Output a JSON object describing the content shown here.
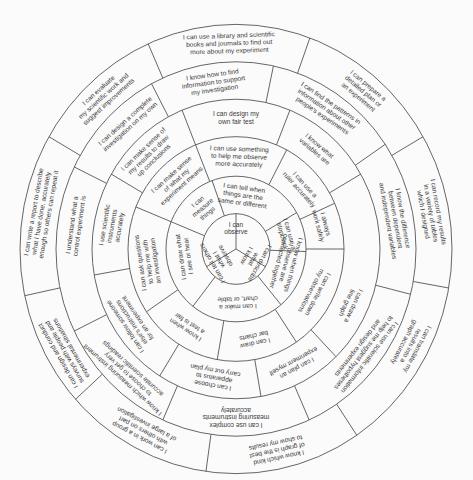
{
  "diagram": {
    "line_color": "#555555",
    "text_color": "#3a3a3a",
    "background": "#fbfbfb",
    "rings": [
      {
        "level": 1,
        "segments": [
          {
            "lines": [
              "I can",
              "observe"
            ],
            "angle": 0
          },
          {
            "lines": [
              "I can describe",
              "what",
              "I know"
            ],
            "angle": 120
          },
          {
            "lines": [
              "I can tell others",
              "what I",
              "observe"
            ],
            "angle": 240
          }
        ]
      },
      {
        "level": 2,
        "segments": [
          {
            "lines": [
              "I can tell when",
              "things are the",
              "same or different"
            ],
            "angle": 8
          },
          {
            "lines": [
              "I can use a",
              "stopclock"
            ],
            "angle": 75
          },
          {
            "lines": [
              "I know when things",
              "I observe are",
              "connected together"
            ],
            "angle": 105
          },
          {
            "lines": [
              "I can make a",
              "chart, or table"
            ],
            "angle": 178
          },
          {
            "lines": [
              "I can draw what",
              "I see or hear"
            ],
            "angle": 262
          },
          {
            "lines": [
              "I can",
              "measure",
              "things"
            ],
            "angle": 320
          }
        ]
      },
      {
        "level": 3,
        "segments": [
          {
            "lines": [
              "I can use something",
              "to help me observe",
              "more accurately"
            ],
            "angle": 2
          },
          {
            "lines": [
              "I can use a",
              "ruler accurately"
            ],
            "angle": 48
          },
          {
            "lines": [
              "I always",
              "work safely"
            ],
            "angle": 75
          },
          {
            "lines": [
              "I can write down",
              "my observations"
            ],
            "angle": 118
          },
          {
            "lines": [
              "I can draw",
              "bar charts"
            ],
            "angle": 168
          },
          {
            "lines": [
              "I know when",
              "a test is fair"
            ],
            "angle": 213
          },
          {
            "lines": [
              "I can ask questions",
              "to help me with",
              "an investigation"
            ],
            "angle": 262
          },
          {
            "lines": [
              "I can make sense",
              "of what my",
              "experiment means"
            ],
            "angle": 318
          }
        ]
      },
      {
        "level": 4,
        "segments": [
          {
            "lines": [
              "I can design my",
              "own fair test"
            ],
            "angle": 0
          },
          {
            "lines": [
              "I know what",
              "variables are"
            ],
            "angle": 40
          },
          {
            "lines": [
              "I can draw a",
              "line graph"
            ],
            "angle": 115
          },
          {
            "lines": [
              "I can plan an",
              "experiment myself"
            ],
            "angle": 152
          },
          {
            "lines": [
              "I can choose",
              "apparatus to",
              "carry out my plan"
            ],
            "angle": 190
          },
          {
            "lines": [
              "I can follow someone",
              "else's instructions",
              "for an experiment"
            ],
            "angle": 236
          },
          {
            "lines": [
              "I use scientific",
              "instruments",
              "accurately"
            ],
            "angle": 280
          },
          {
            "lines": [
              "I can make sense of",
              "my results to draw",
              "up conclusions"
            ],
            "angle": 316
          }
        ]
      },
      {
        "level": 5,
        "segments": [
          {
            "lines": [
              "I know how to find",
              "information to support",
              "my investigation"
            ],
            "angle": 352
          },
          {
            "lines": [
              "I can find the patterns in",
              "information about other",
              "people's experiments"
            ],
            "angle": 34
          },
          {
            "lines": [
              "I know the difference",
              "between dependent",
              "and independent variables"
            ],
            "angle": 80
          },
          {
            "lines": [
              "I can use scientific information",
              "to help me suggest hypotheses",
              "and design experiments"
            ],
            "angle": 128
          },
          {
            "lines": [
              "I can use complex",
              "measuring instruments",
              "accurately"
            ],
            "angle": 180
          },
          {
            "lines": [
              "I know which measuring instrument",
              "to choose to get very",
              "accurate scientific readings"
            ],
            "angle": 222
          },
          {
            "lines": [
              "I understand what a",
              "control experiment is"
            ],
            "angle": 278
          },
          {
            "lines": [
              "I can design a complete",
              "investigation on my own"
            ],
            "angle": 318
          }
        ]
      },
      {
        "level": 6,
        "segments": [
          {
            "lines": [
              "I can use a library and scientific",
              "books and journals to find out",
              "more about my experiment"
            ],
            "angle": 358
          },
          {
            "lines": [
              "I can prepare a",
              "detailed plan or",
              "an experiment"
            ],
            "angle": 40
          },
          {
            "lines": [
              "I can record my results",
              "in a variety of tables",
              "which I designed"
            ],
            "angle": 80
          },
          {
            "lines": [
              "I can translate my",
              "results into a",
              "graph accurately"
            ],
            "angle": 118
          },
          {
            "lines": [
              "I know which kind",
              "of graph is the best",
              "to show my results"
            ],
            "angle": 168
          },
          {
            "lines": [
              "I can work in a group",
              "with others on part",
              "of a large investigation"
            ],
            "angle": 208
          },
          {
            "lines": [
              "I can design and conduct",
              "surveys with people and",
              "experimental situations"
            ],
            "angle": 240
          },
          {
            "lines": [
              "I can write a report to describe",
              "what I have done, accurately",
              "enough so others can repeat it"
            ],
            "angle": 280
          },
          {
            "lines": [
              "I can evaluate",
              "my scientific work and",
              "suggest improvements"
            ],
            "angle": 318
          }
        ]
      }
    ],
    "dividers": [
      [
        0,
        120,
        240
      ],
      [
        60,
        92,
        140,
        218,
        292,
        340
      ],
      [
        28,
        66,
        90,
        146,
        190,
        236,
        292,
        338
      ],
      [
        22,
        60,
        136,
        170,
        212,
        260,
        300,
        338
      ],
      [
        12,
        56,
        104,
        156,
        204,
        244,
        296,
        332
      ],
      [
        20,
        60,
        100,
        146,
        188,
        228,
        258,
        300,
        336
      ]
    ]
  }
}
